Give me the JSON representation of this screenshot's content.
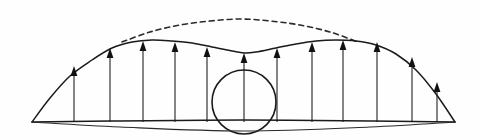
{
  "figure": {
    "background_color": "#fefefe",
    "line_color": "#1a1a1a",
    "width": 479,
    "height": 140
  },
  "chart_data": {
    "type": "line",
    "xlabel": "",
    "ylabel": "",
    "grid": false,
    "legend_position": "none",
    "xlim": [
      0,
      479
    ],
    "ylim": [
      140,
      0
    ],
    "annotations": [
      "Solid curve: actual bimodal lift distribution with central dip over body",
      "Dashed curve: ideal elliptical reference lift distribution",
      "Arrows: distributed upward lift load, length proportional to local lift",
      "Circle: central body / fuselage cross-section",
      "Double baseline: chord reference lines"
    ],
    "series": [
      {
        "name": "actual-lift-curve",
        "style": "solid",
        "x": [
          32,
          50,
          70,
          92,
          112,
          132,
          152,
          172,
          192,
          212,
          232,
          244,
          256,
          276,
          296,
          316,
          336,
          356,
          376,
          396,
          416,
          436,
          455
        ],
        "y": [
          122,
          98,
          76,
          60,
          48,
          42,
          40,
          41,
          43,
          47,
          51,
          53,
          52,
          48,
          44,
          41,
          40,
          41,
          45,
          54,
          70,
          94,
          122
        ]
      },
      {
        "name": "ideal-elliptical-curve",
        "style": "dashed",
        "x": [
          122,
          150,
          180,
          210,
          240,
          270,
          300,
          330,
          358
        ],
        "y": [
          42,
          32,
          25,
          21,
          19,
          21,
          25,
          32,
          42
        ]
      },
      {
        "name": "baseline-upper-chord",
        "style": "solid",
        "x": [
          32,
          120,
          244,
          370,
          455
        ],
        "y": [
          122,
          121,
          120,
          121,
          122
        ]
      },
      {
        "name": "baseline-lower-chord",
        "style": "solid",
        "x": [
          32,
          120,
          244,
          370,
          455
        ],
        "y": [
          122,
          127,
          131,
          127,
          122
        ]
      }
    ],
    "load_arrows": {
      "count": 12,
      "direction": "up",
      "base_y": 122,
      "items": [
        {
          "x": 74,
          "tip_y": 66,
          "length": 56
        },
        {
          "x": 110,
          "tip_y": 48,
          "length": 74
        },
        {
          "x": 143,
          "tip_y": 41,
          "length": 81
        },
        {
          "x": 175,
          "tip_y": 42,
          "length": 80
        },
        {
          "x": 207,
          "tip_y": 47,
          "length": 75
        },
        {
          "x": 244,
          "tip_y": 53,
          "length": 69
        },
        {
          "x": 277,
          "tip_y": 48,
          "length": 74
        },
        {
          "x": 312,
          "tip_y": 42,
          "length": 80
        },
        {
          "x": 343,
          "tip_y": 40,
          "length": 82
        },
        {
          "x": 377,
          "tip_y": 42,
          "length": 80
        },
        {
          "x": 412,
          "tip_y": 57,
          "length": 65
        },
        {
          "x": 437,
          "tip_y": 82,
          "length": 40
        }
      ]
    },
    "center_body": {
      "shape": "circle",
      "cx": 244,
      "cy": 102,
      "r": 32
    }
  }
}
